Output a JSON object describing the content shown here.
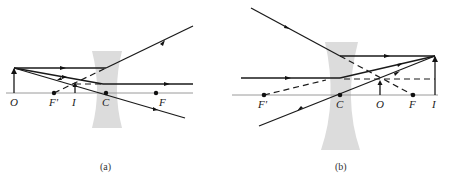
{
  "figure": {
    "panels": [
      {
        "caption": "(a)",
        "lens_type": "diverging (concave) lens",
        "labels": {
          "object": "O",
          "front_focus": "F'",
          "image": "I",
          "center": "C",
          "back_focus": "F"
        }
      },
      {
        "caption": "(b)",
        "lens_type": "diverging (concave) lens",
        "labels": {
          "front_focus": "F'",
          "center": "C",
          "object": "O",
          "back_focus": "F",
          "image": "I"
        }
      }
    ],
    "colors": {
      "ray": "#1a1a1a",
      "lens": "#dcdcdc",
      "axis": "#9a9a9a",
      "background": "#ffffff"
    }
  }
}
